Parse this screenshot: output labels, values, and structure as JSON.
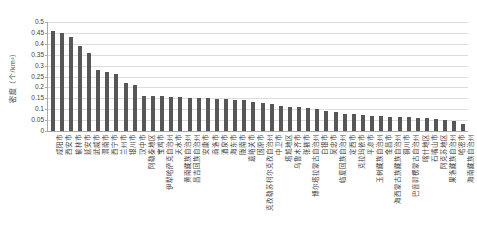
{
  "chart_data": {
    "type": "bar",
    "title": "",
    "xlabel": "",
    "ylabel": "密度（个/km²）",
    "ylim": [
      0,
      0.5
    ],
    "ytick_step": 0.05,
    "yticks": [
      "0",
      "0.05",
      "0.1",
      "0.15",
      "0.2",
      "0.25",
      "0.3",
      "0.35",
      "0.4",
      "0.45",
      "0.5"
    ],
    "grid": true,
    "legend_position": "none",
    "bar_color": "#575757",
    "gridline_color": "#dcdcdc",
    "axis_color": "#a9a9a9",
    "categories": [
      "咸阳市",
      "西安市",
      "榆林市",
      "延安市",
      "武威市",
      "渭南市",
      "西宁市",
      "兰州市",
      "银川市",
      "汉中市",
      "阿勒泰地区",
      "宝鸡市",
      "伊犁哈萨克自治州",
      "天水市",
      "黄南藏族自治州",
      "昌吉回族自治州",
      "安康市",
      "商洛市",
      "酒泉市",
      "海东市",
      "陇南市",
      "嘉峪关市",
      "固原市",
      "克孜勒苏柯尔克孜自治州",
      "中卫市",
      "塔城地区",
      "乌鲁木齐市",
      "张掖市",
      "博尔塔拉蒙古自治州",
      "白银市",
      "吴忠市",
      "临夏回族自治州",
      "定西市",
      "克拉玛依市",
      "平凉市",
      "玉树藏族自治州",
      "金昌市",
      "海西蒙古族藏族自治州",
      "铜川市",
      "巴音郭楞蒙古自治州",
      "喀什地区",
      "石嘴山市",
      "阿克苏地区",
      "果洛藏族自治州",
      "哈密市",
      "海南藏族自治州"
    ],
    "values": [
      0.46,
      0.45,
      0.43,
      0.39,
      0.36,
      0.28,
      0.27,
      0.26,
      0.22,
      0.21,
      0.16,
      0.16,
      0.16,
      0.155,
      0.155,
      0.15,
      0.15,
      0.15,
      0.145,
      0.145,
      0.14,
      0.14,
      0.135,
      0.13,
      0.125,
      0.115,
      0.11,
      0.11,
      0.105,
      0.1,
      0.09,
      0.085,
      0.08,
      0.08,
      0.075,
      0.07,
      0.07,
      0.065,
      0.065,
      0.065,
      0.06,
      0.06,
      0.055,
      0.05,
      0.045,
      0.03
    ]
  }
}
